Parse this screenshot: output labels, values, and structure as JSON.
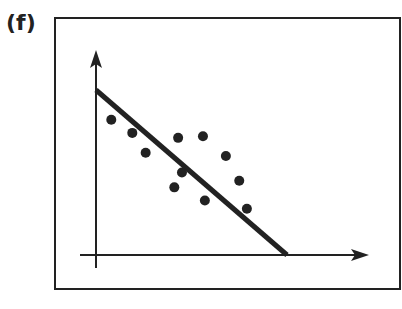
{
  "panel_label": "(f)",
  "colors": {
    "ink": "#222222",
    "background": "#ffffff"
  },
  "chart_data": {
    "type": "scatter",
    "title": "",
    "xlabel": "",
    "ylabel": "",
    "grid": false,
    "legend": null,
    "points": [
      {
        "x": 0.08,
        "y": 0.82
      },
      {
        "x": 0.19,
        "y": 0.74
      },
      {
        "x": 0.26,
        "y": 0.62
      },
      {
        "x": 0.43,
        "y": 0.71
      },
      {
        "x": 0.56,
        "y": 0.72
      },
      {
        "x": 0.68,
        "y": 0.6
      },
      {
        "x": 0.45,
        "y": 0.5
      },
      {
        "x": 0.41,
        "y": 0.41
      },
      {
        "x": 0.57,
        "y": 0.33
      },
      {
        "x": 0.75,
        "y": 0.45
      },
      {
        "x": 0.79,
        "y": 0.28
      }
    ],
    "trend_line": {
      "x1": 0.0,
      "y1": 1.0,
      "x2": 1.0,
      "y2": 0.0
    },
    "annotation": "negative linear trend line through scatter points"
  }
}
